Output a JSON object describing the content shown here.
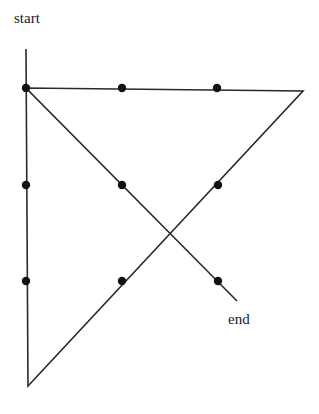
{
  "diagram": {
    "labels": {
      "start": "start",
      "end": "end"
    },
    "colors": {
      "line": "#2a2a2a",
      "dot": "#111111",
      "background": "#ffffff"
    },
    "dots": [
      {
        "row": 0,
        "col": 0,
        "x": 26,
        "y": 88
      },
      {
        "row": 0,
        "col": 1,
        "x": 122,
        "y": 88
      },
      {
        "row": 0,
        "col": 2,
        "x": 217,
        "y": 88
      },
      {
        "row": 1,
        "col": 0,
        "x": 26,
        "y": 185
      },
      {
        "row": 1,
        "col": 1,
        "x": 122,
        "y": 185
      },
      {
        "row": 1,
        "col": 2,
        "x": 218,
        "y": 185
      },
      {
        "row": 2,
        "col": 0,
        "x": 26,
        "y": 281
      },
      {
        "row": 2,
        "col": 1,
        "x": 122,
        "y": 281
      },
      {
        "row": 2,
        "col": 2,
        "x": 218,
        "y": 281
      }
    ],
    "path": [
      {
        "x": 26,
        "y": 49
      },
      {
        "x": 28,
        "y": 386
      },
      {
        "x": 303,
        "y": 91
      },
      {
        "x": 26,
        "y": 88
      },
      {
        "x": 237,
        "y": 301
      }
    ]
  }
}
